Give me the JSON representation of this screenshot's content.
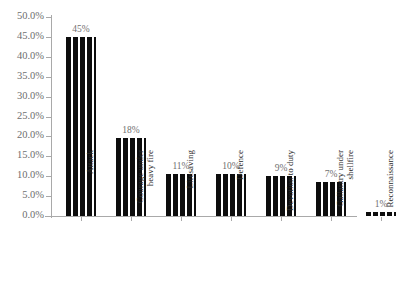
{
  "chart_data": {
    "type": "bar",
    "title": "",
    "xlabel": "",
    "ylabel": "",
    "ylim": [
      0,
      50
    ],
    "grid": false,
    "legend": "none",
    "orientation": "vertical",
    "bar_fill": "vertical-striped-black-white",
    "categories": [
      "Attack",
      "Courage under\nheavy fire",
      "Lifesaving",
      "Defence",
      "Devotion to duty",
      "Gallantry under\nshellfire",
      "Reconnaissance"
    ],
    "values": [
      45,
      19.5,
      10.5,
      10.5,
      10,
      8.5,
      1
    ],
    "data_labels": [
      "45%",
      "18%",
      "11%",
      "10%",
      "9%",
      "7%",
      "1%"
    ],
    "ytick_labels": [
      "0.0%",
      "5.0%",
      "10.0%",
      "15.0%",
      "20.0%",
      "25.0%",
      "30.0%",
      "35.0%",
      "40.0%",
      "45.0%",
      "50.0%"
    ],
    "ytick_values": [
      0,
      5,
      10,
      15,
      20,
      25,
      30,
      35,
      40,
      45,
      50
    ]
  },
  "colors": {
    "background": "#ffffff",
    "axis": "#a9a9a9",
    "bar_dark": "#0d0d0d",
    "bar_light": "#ffffff",
    "ytick_text": "#6e6e6e",
    "value_text": "#707070",
    "category_text": "#2b2b2b"
  },
  "layout": {
    "axis_x": 52,
    "baseline_y": 216,
    "top_y": 17,
    "bar_width": 30,
    "bar_pitch": 50,
    "first_bar_left": 66
  }
}
